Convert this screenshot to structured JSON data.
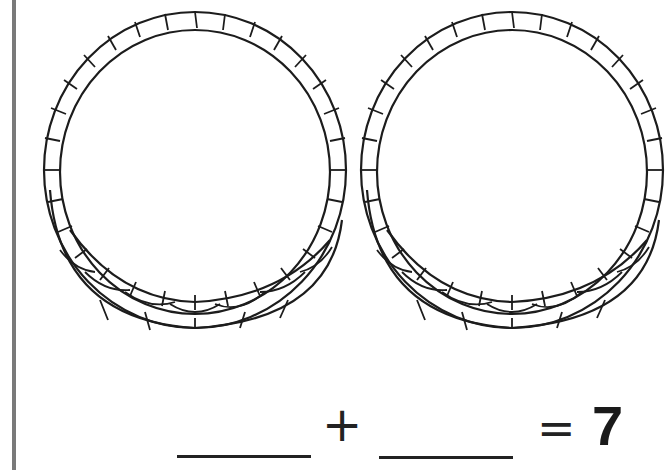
{
  "worksheet": {
    "baskets": [
      {
        "id": "basket-left",
        "contents": "empty"
      },
      {
        "id": "basket-right",
        "contents": "empty"
      }
    ],
    "equation": {
      "blank_1": "",
      "operator": "+",
      "blank_2": "",
      "equals": "=",
      "total": "7"
    }
  }
}
